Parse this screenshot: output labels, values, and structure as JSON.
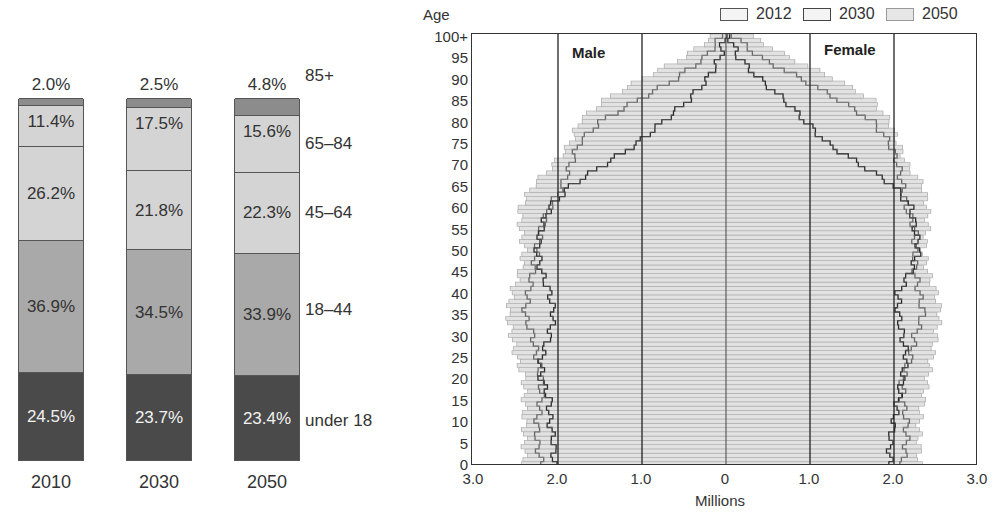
{
  "chart_data": [
    {
      "type": "bar",
      "subtype": "stacked-100",
      "title": "",
      "categories": [
        "2010",
        "2030",
        "2050"
      ],
      "series": [
        {
          "name": "under 18",
          "values": [
            24.5,
            23.7,
            23.4
          ],
          "color": "#4a4a4a",
          "label_color": "#f2f2f2"
        },
        {
          "name": "18–44",
          "values": [
            36.9,
            34.5,
            33.9
          ],
          "color": "#a9a9a9",
          "label_color": "#333333"
        },
        {
          "name": "45–64",
          "values": [
            26.2,
            21.8,
            22.3
          ],
          "color": "#d4d4d4",
          "label_color": "#333333"
        },
        {
          "name": "65–84",
          "values": [
            11.4,
            17.5,
            15.6
          ],
          "color": "#d4d4d4",
          "label_color": "#333333"
        },
        {
          "name": "85+",
          "values": [
            2.0,
            2.5,
            4.8
          ],
          "color": "#8c8c8c",
          "label_color": "#333333"
        }
      ],
      "top_labels": [
        "2.0%",
        "2.5%",
        "4.8%"
      ],
      "value_labels": {
        "2010": [
          "24.5%",
          "36.9%",
          "26.2%",
          "11.4%"
        ],
        "2030": [
          "23.7%",
          "34.5%",
          "21.8%",
          "17.5%"
        ],
        "2050": [
          "23.4%",
          "33.9%",
          "22.3%",
          "15.6%"
        ]
      },
      "category_labels": [
        "85+",
        "65–84",
        "45–64",
        "18–44",
        "under 18"
      ],
      "xlabel": "",
      "ylabel": "",
      "ylim": [
        0,
        100
      ]
    },
    {
      "type": "bar",
      "subtype": "population-pyramid",
      "title": "",
      "ylabel": "Age",
      "xlabel": "Millions",
      "xlim": [
        -3.0,
        3.0
      ],
      "xticks": [
        "3.0",
        "2.0",
        "1.0",
        "0",
        "1.0",
        "2.0",
        "3.0"
      ],
      "yticks": [
        "0",
        "5",
        "10",
        "15",
        "20",
        "25",
        "30",
        "35",
        "40",
        "45",
        "50",
        "55",
        "60",
        "65",
        "70",
        "75",
        "80",
        "85",
        "90",
        "95",
        "100+"
      ],
      "side_labels": {
        "left": "Male",
        "right": "Female"
      },
      "legend": [
        "2012",
        "2030",
        "2050"
      ],
      "legend_position": "top-right",
      "grid_x": [
        -2.0,
        -1.0,
        0,
        1.0,
        2.0
      ],
      "ages_step": 5,
      "series": [
        {
          "name": "2012",
          "male": [
            2.05,
            2.05,
            2.1,
            2.1,
            2.2,
            2.2,
            2.1,
            2.05,
            2.1,
            2.2,
            2.25,
            2.2,
            2.1,
            1.85,
            1.45,
            1.05,
            0.75,
            0.45,
            0.22,
            0.07,
            0.02
          ],
          "female": [
            1.95,
            1.95,
            2.0,
            2.05,
            2.1,
            2.15,
            2.1,
            2.05,
            2.05,
            2.2,
            2.3,
            2.25,
            2.2,
            2.0,
            1.6,
            1.2,
            0.95,
            0.7,
            0.4,
            0.15,
            0.04
          ]
        },
        {
          "name": "2030",
          "male": [
            2.2,
            2.25,
            2.25,
            2.2,
            2.2,
            2.25,
            2.3,
            2.4,
            2.35,
            2.3,
            2.25,
            2.2,
            2.1,
            1.95,
            1.85,
            1.75,
            1.5,
            1.05,
            0.6,
            0.25,
            0.05
          ],
          "female": [
            2.1,
            2.15,
            2.15,
            2.1,
            2.1,
            2.2,
            2.25,
            2.35,
            2.3,
            2.25,
            2.25,
            2.25,
            2.15,
            2.1,
            2.05,
            1.95,
            1.75,
            1.35,
            0.9,
            0.4,
            0.1
          ]
        },
        {
          "name": "2050",
          "male": [
            2.4,
            2.4,
            2.4,
            2.4,
            2.4,
            2.5,
            2.55,
            2.6,
            2.55,
            2.45,
            2.4,
            2.45,
            2.45,
            2.3,
            2.05,
            1.85,
            1.75,
            1.45,
            1.0,
            0.5,
            0.15
          ],
          "female": [
            2.3,
            2.3,
            2.3,
            2.35,
            2.4,
            2.45,
            2.5,
            2.55,
            2.5,
            2.4,
            2.35,
            2.4,
            2.4,
            2.35,
            2.15,
            2.05,
            1.95,
            1.75,
            1.3,
            0.75,
            0.3
          ]
        }
      ]
    }
  ]
}
